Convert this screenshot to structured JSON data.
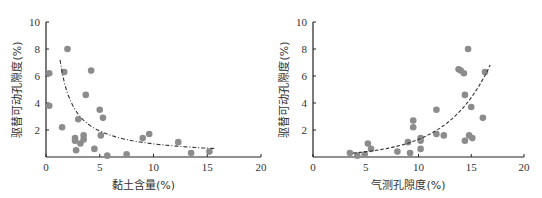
{
  "chart_data": [
    {
      "type": "scatter",
      "title": "",
      "xlabel": "黏土含量(%)",
      "ylabel": "驱替可动孔隙度(%)",
      "xlim": [
        0,
        20
      ],
      "ylim": [
        0,
        10
      ],
      "xticks": [
        0,
        5,
        10,
        15,
        20
      ],
      "yticks": [
        2,
        4,
        6,
        8,
        10
      ],
      "y_origin_label": "0",
      "grid": false,
      "legend": null,
      "marker_color": "#8c8c8c",
      "trendline": {
        "style": "dash-dot",
        "type": "power/decay",
        "x_range": [
          1.3,
          15.7
        ]
      },
      "points": [
        [
          0.3,
          6.2
        ],
        [
          0.3,
          3.8
        ],
        [
          1.7,
          6.3
        ],
        [
          2.0,
          8.0
        ],
        [
          1.5,
          2.2
        ],
        [
          2.7,
          1.4
        ],
        [
          2.7,
          1.2
        ],
        [
          2.8,
          0.5
        ],
        [
          3.0,
          2.8
        ],
        [
          3.2,
          1.0
        ],
        [
          3.5,
          1.6
        ],
        [
          3.5,
          1.3
        ],
        [
          3.7,
          4.6
        ],
        [
          4.2,
          6.4
        ],
        [
          4.5,
          0.6
        ],
        [
          5.0,
          3.5
        ],
        [
          5.1,
          1.6
        ],
        [
          5.3,
          2.9
        ],
        [
          5.7,
          0.1
        ],
        [
          7.5,
          0.2
        ],
        [
          9.0,
          1.4
        ],
        [
          9.6,
          1.7
        ],
        [
          12.3,
          1.1
        ],
        [
          13.5,
          0.3
        ],
        [
          15.2,
          0.4
        ]
      ]
    },
    {
      "type": "scatter",
      "title": "",
      "xlabel": "气测孔隙度(%)",
      "ylabel": "驱替可动孔隙度(%)",
      "xlim": [
        0,
        20
      ],
      "ylim": [
        0,
        10
      ],
      "xticks": [
        0,
        5,
        10,
        15,
        20
      ],
      "yticks": [
        2,
        4,
        6,
        8,
        10
      ],
      "grid": false,
      "legend": null,
      "marker_color": "#8c8c8c",
      "trendline": {
        "style": "dashed",
        "type": "exponential",
        "x_range": [
          3.8,
          16.8
        ]
      },
      "points": [
        [
          3.5,
          0.3
        ],
        [
          4.2,
          0.1
        ],
        [
          4.9,
          0.2
        ],
        [
          5.2,
          1.0
        ],
        [
          5.5,
          0.6
        ],
        [
          8.0,
          0.4
        ],
        [
          9.0,
          1.1
        ],
        [
          9.2,
          0.3
        ],
        [
          9.5,
          2.7
        ],
        [
          9.5,
          2.2
        ],
        [
          10.2,
          1.4
        ],
        [
          10.2,
          1.2
        ],
        [
          10.2,
          0.6
        ],
        [
          11.7,
          3.5
        ],
        [
          11.7,
          1.7
        ],
        [
          12.4,
          1.6
        ],
        [
          13.8,
          6.5
        ],
        [
          14.0,
          6.4
        ],
        [
          14.3,
          6.2
        ],
        [
          14.4,
          4.6
        ],
        [
          14.4,
          1.2
        ],
        [
          14.7,
          8.0
        ],
        [
          14.8,
          1.6
        ],
        [
          15.0,
          3.7
        ],
        [
          15.1,
          1.4
        ],
        [
          16.1,
          2.9
        ],
        [
          16.3,
          6.3
        ]
      ]
    }
  ]
}
